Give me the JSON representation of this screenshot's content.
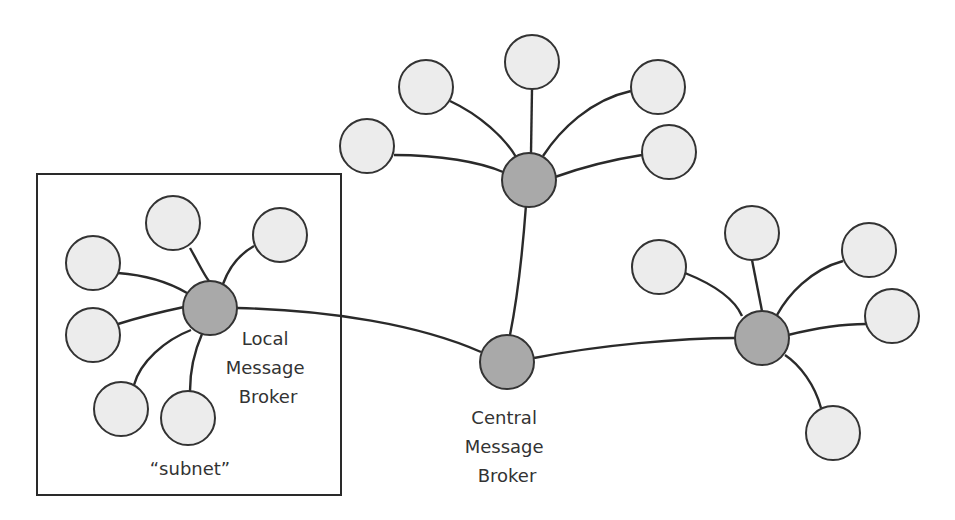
{
  "colors": {
    "broker_fill": "#a9a9a9",
    "leaf_fill": "#ececec",
    "stroke": "#333333",
    "background": "#ffffff"
  },
  "labels": {
    "local_broker": [
      "Local",
      "Message",
      "Broker"
    ],
    "central_broker": [
      "Central",
      "Message",
      "Broker"
    ],
    "subnet": "“subnet”"
  },
  "brokers": [
    {
      "id": "local",
      "x": 210,
      "y": 308
    },
    {
      "id": "central",
      "x": 507,
      "y": 362
    },
    {
      "id": "top",
      "x": 529,
      "y": 180
    },
    {
      "id": "right",
      "x": 762,
      "y": 338
    }
  ],
  "leaves": {
    "local": [
      [
        173,
        223
      ],
      [
        280,
        235
      ],
      [
        93,
        263
      ],
      [
        93,
        335
      ],
      [
        121,
        409
      ],
      [
        188,
        418
      ]
    ],
    "top": [
      [
        532,
        62
      ],
      [
        426,
        87
      ],
      [
        367,
        146
      ],
      [
        658,
        87
      ],
      [
        669,
        152
      ]
    ],
    "right": [
      [
        752,
        233
      ],
      [
        659,
        267
      ],
      [
        869,
        250
      ],
      [
        892,
        316
      ],
      [
        833,
        433
      ]
    ]
  }
}
